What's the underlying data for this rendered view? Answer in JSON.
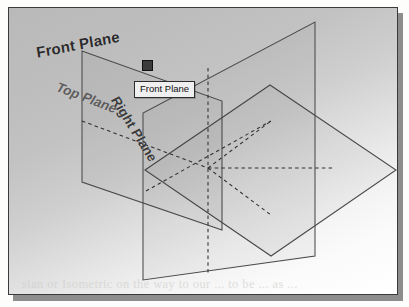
{
  "scan": {
    "bleed_top_text": "marriage control",
    "bleed_bottom_text": "sian or Isometric on the way to our ... to be ... as ..."
  },
  "cad": {
    "window_title": "",
    "viewport": {
      "background_style": "radial-gray-to-white-gradient",
      "model_type": "reference-planes"
    },
    "labels": {
      "front_plane": "Front Plane",
      "top_plane": "Top Plane",
      "right_plane": "Right Plane"
    },
    "tooltip": {
      "text": "Front Plane",
      "visible": true
    },
    "selection_handle": {
      "visible": true,
      "shape": "square"
    }
  },
  "colors": {
    "frame_border": "#3a3a3a",
    "shadow": "#8d8d8d",
    "plane_edge": "#4a4a4a",
    "plane_hidden_edge": "#2e2e2e",
    "label_text": "#2a2a2a",
    "tooltip_bg": "#efefef",
    "tooltip_border": "#2c2c2c",
    "handle_fill": "#3b3b3b"
  }
}
